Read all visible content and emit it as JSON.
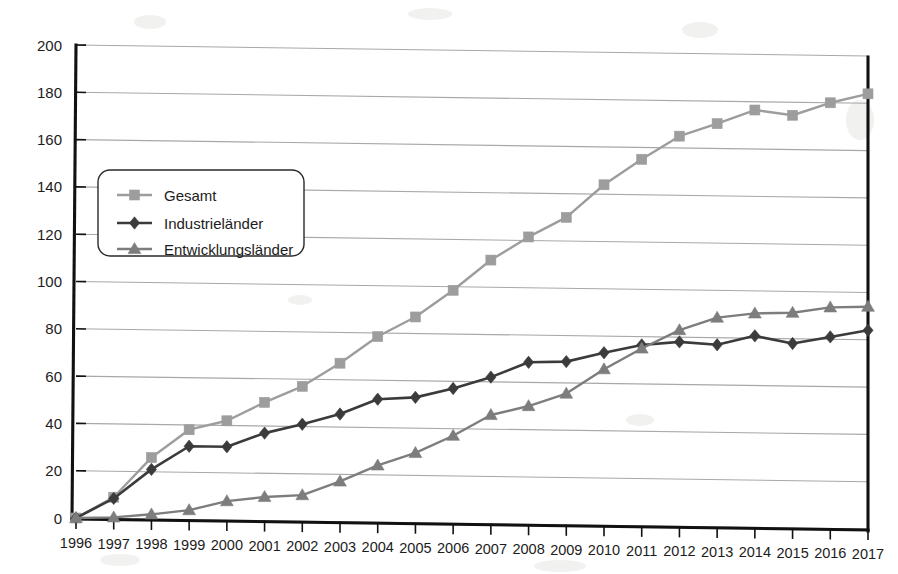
{
  "chart_data": {
    "type": "line",
    "title": "",
    "subtitle": "",
    "xlabel": "",
    "ylabel": "",
    "x": [
      1996,
      1997,
      1998,
      1999,
      2000,
      2001,
      2002,
      2003,
      2004,
      2005,
      2006,
      2007,
      2008,
      2009,
      2010,
      2011,
      2012,
      2013,
      2014,
      2015,
      2016,
      2017
    ],
    "categories": [
      "1996",
      "1997",
      "1998",
      "1999",
      "2000",
      "2001",
      "2002",
      "2003",
      "2004",
      "2005",
      "2006",
      "2007",
      "2008",
      "2009",
      "2010",
      "2011",
      "2012",
      "2013",
      "2014",
      "2015",
      "2016",
      "2017"
    ],
    "series": [
      {
        "name": "Gesamt",
        "color": "#9d9d9d",
        "marker": "square",
        "values": [
          0,
          9,
          26,
          38,
          42,
          50,
          57,
          67,
          78.5,
          87,
          98.5,
          111.5,
          121.5,
          130,
          144,
          155,
          165,
          170.5,
          176.5,
          174.5,
          180,
          184
        ]
      },
      {
        "name": "Industrieländer",
        "color": "#3b3b3b",
        "marker": "diamond",
        "values": [
          0,
          8.5,
          21,
          31,
          31,
          37,
          41,
          45.5,
          52,
          53,
          57,
          62,
          68.5,
          69,
          73,
          76.5,
          78,
          77,
          81,
          78,
          81,
          84
        ]
      },
      {
        "name": "Entwicklungsländer",
        "color": "#7d7d7d",
        "marker": "triangle",
        "values": [
          0,
          0.5,
          2,
          4,
          8,
          10,
          11,
          17,
          24,
          29.5,
          37,
          46,
          50,
          55.5,
          66,
          75,
          83,
          88.5,
          90.5,
          91,
          93.5,
          94
        ]
      }
    ],
    "ylim": [
      0,
      200
    ],
    "ytick_values": [
      0,
      20,
      40,
      60,
      80,
      100,
      120,
      140,
      160,
      180,
      200
    ],
    "ytick_labels": [
      "0",
      "20",
      "40",
      "60",
      "80",
      "100",
      "120",
      "140",
      "160",
      "180",
      "200"
    ],
    "grid": true,
    "grid_axis": "y",
    "legend_position": "upper-left-inside"
  },
  "legend": {
    "items": [
      {
        "label": "Gesamt"
      },
      {
        "label": "Industrieländer"
      },
      {
        "label": "Entwicklungsländer"
      }
    ]
  },
  "colors": {
    "gesamt": "#9d9d9d",
    "industrielaender": "#3b3b3b",
    "entwicklungslaender": "#7d7d7d",
    "gridline": "#a8a8a8",
    "axis": "#111111",
    "background": "#ffffff"
  }
}
